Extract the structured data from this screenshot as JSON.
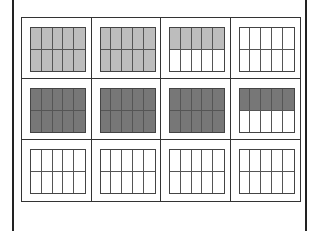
{
  "figure": {
    "colors": {
      "light": "#bdbdbd",
      "dark": "#777777",
      "empty": "#ffffff",
      "line": "#333333"
    },
    "rows": [
      {
        "cells": [
          {
            "fill": "light",
            "shaded": "all"
          },
          {
            "fill": "light",
            "shaded": "all"
          },
          {
            "fill": "light",
            "shaded": "top"
          },
          {
            "fill": "empty",
            "shaded": "none"
          }
        ]
      },
      {
        "cells": [
          {
            "fill": "dark",
            "shaded": "all"
          },
          {
            "fill": "dark",
            "shaded": "all"
          },
          {
            "fill": "dark",
            "shaded": "all"
          },
          {
            "fill": "dark",
            "shaded": "top"
          }
        ]
      },
      {
        "cells": [
          {
            "fill": "empty",
            "shaded": "none"
          },
          {
            "fill": "empty",
            "shaded": "none"
          },
          {
            "fill": "empty",
            "shaded": "none"
          },
          {
            "fill": "empty",
            "shaded": "none"
          }
        ]
      }
    ]
  }
}
